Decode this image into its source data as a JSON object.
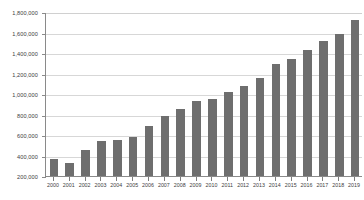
{
  "chart_data": {
    "type": "bar",
    "title": "",
    "subtitle": "",
    "xlabel": "",
    "ylabel": "",
    "grid": true,
    "legend": false,
    "legend_position": "none",
    "bar_color": "#6e6e6e",
    "gridline_color": "#d7d7d7",
    "axis_color": "#8a8a8a",
    "text_color": "#3d3d3d",
    "background_color": "#ffffff",
    "ylim": [
      200000,
      1800000
    ],
    "ytick_values": [
      200000,
      400000,
      600000,
      800000,
      1000000,
      1200000,
      1400000,
      1600000,
      1800000
    ],
    "ytick_labels": [
      "200,000",
      "400,000",
      "600,000",
      "800,000",
      "1,000,000",
      "1,200,000",
      "1,400,000",
      "1,600,000",
      "1,800,000"
    ],
    "categories": [
      "2000",
      "2001",
      "2002",
      "2003",
      "2004",
      "2005",
      "2006",
      "2007",
      "2008",
      "2009",
      "2010",
      "2011",
      "2012",
      "2013",
      "2014",
      "2015",
      "2016",
      "2017",
      "2018",
      "2019"
    ],
    "values": [
      370000,
      330000,
      455000,
      540000,
      555000,
      585000,
      685000,
      790000,
      855000,
      930000,
      950000,
      1020000,
      1080000,
      1160000,
      1290000,
      1340000,
      1430000,
      1520000,
      1590000,
      1720000
    ]
  }
}
